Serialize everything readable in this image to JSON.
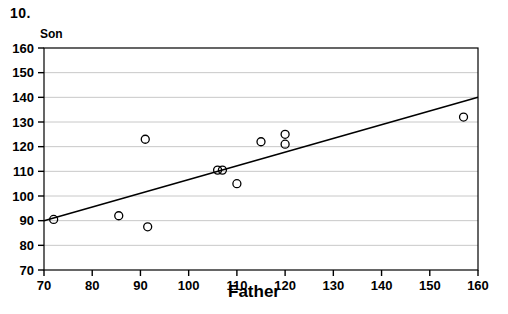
{
  "figure": {
    "problem_number": "10.",
    "y_axis_caption": "Son",
    "x_axis_caption": "Father"
  },
  "chart_data": {
    "type": "scatter",
    "title": "",
    "xlabel": "Father",
    "ylabel": "Son",
    "xlim": [
      70,
      160
    ],
    "ylim": [
      70,
      160
    ],
    "xticks": [
      70,
      80,
      90,
      100,
      110,
      120,
      130,
      140,
      150,
      160
    ],
    "yticks": [
      70,
      80,
      90,
      100,
      110,
      120,
      130,
      140,
      150,
      160
    ],
    "xtick_labels": [
      "70",
      "80",
      "90",
      "100",
      "110",
      "120",
      "130",
      "140",
      "150",
      "160"
    ],
    "ytick_labels": [
      "70",
      "80",
      "90",
      "100",
      "110",
      "120",
      "130",
      "140",
      "150",
      "160"
    ],
    "grid": "horizontal",
    "legend": null,
    "marker": "open-circle",
    "marker_color": "#000000",
    "marker_fill": "none",
    "points": [
      {
        "x": 72,
        "y": 90.5
      },
      {
        "x": 85.5,
        "y": 92
      },
      {
        "x": 91,
        "y": 123
      },
      {
        "x": 91.5,
        "y": 87.5
      },
      {
        "x": 106,
        "y": 110.5
      },
      {
        "x": 107,
        "y": 110.5
      },
      {
        "x": 110,
        "y": 105
      },
      {
        "x": 115,
        "y": 122
      },
      {
        "x": 120,
        "y": 125
      },
      {
        "x": 120,
        "y": 121
      },
      {
        "x": 157,
        "y": 132
      }
    ],
    "series": [
      {
        "name": "observations",
        "type": "scatter",
        "x": [
          72,
          85.5,
          91,
          91.5,
          106,
          107,
          110,
          115,
          120,
          120,
          157
        ],
        "y": [
          90.5,
          92,
          123,
          87.5,
          110.5,
          110.5,
          105,
          122,
          125,
          121,
          132
        ]
      },
      {
        "name": "regression-line",
        "type": "line",
        "x": [
          70,
          160
        ],
        "y": [
          90,
          140
        ],
        "color": "#000000"
      }
    ],
    "regression_line": {
      "x_start": 70,
      "y_start": 90,
      "x_end": 160,
      "y_end": 140,
      "slope": 0.556,
      "intercept": 51.1
    }
  },
  "colors": {
    "axis": "#000000",
    "grid": "#c8c8c8",
    "marker": "#000000",
    "line": "#000000",
    "background": "#ffffff"
  }
}
